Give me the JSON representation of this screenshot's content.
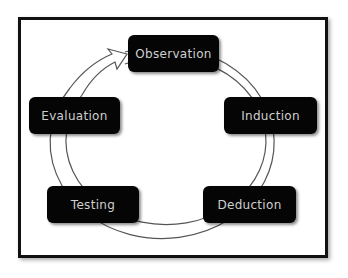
{
  "diagram": {
    "type": "cycle",
    "direction": "clockwise",
    "colors": {
      "frame": "#111111",
      "node_fill": "#050505",
      "node_text": "#cfcfcf",
      "ring_stroke": "#555555",
      "ring_fill": "#ffffff"
    },
    "nodes": [
      {
        "id": "observation",
        "label": "Observation"
      },
      {
        "id": "induction",
        "label": "Induction"
      },
      {
        "id": "deduction",
        "label": "Deduction"
      },
      {
        "id": "testing",
        "label": "Testing"
      },
      {
        "id": "evaluation",
        "label": "Evaluation"
      }
    ],
    "edges": [
      {
        "from": "observation",
        "to": "induction"
      },
      {
        "from": "induction",
        "to": "deduction"
      },
      {
        "from": "deduction",
        "to": "testing"
      },
      {
        "from": "testing",
        "to": "evaluation"
      },
      {
        "from": "evaluation",
        "to": "observation",
        "arrowhead": true
      }
    ]
  }
}
